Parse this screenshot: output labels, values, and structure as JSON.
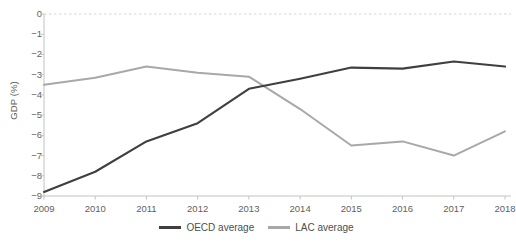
{
  "axis": {
    "y_title": "GDP (%)",
    "y_ticks": [
      "0",
      "-1",
      "-2",
      "-3",
      "-4",
      "-5",
      "-6",
      "-7",
      "-8",
      "-9"
    ],
    "x_ticks": [
      "2009",
      "2010",
      "2011",
      "2012",
      "2013",
      "2014",
      "2015",
      "2016",
      "2017",
      "2018"
    ]
  },
  "legend": {
    "items": [
      {
        "label": "OECD average",
        "color": "#3f3f3f"
      },
      {
        "label": "LAC average",
        "color": "#a8a8a8"
      }
    ]
  },
  "colors": {
    "oecd": "#3f3f3f",
    "lac": "#a8a8a8",
    "zero_line": "#d6d6d6",
    "axis": "#c2c2c2",
    "text": "#5f5f5f",
    "background": "#ffffff"
  },
  "chart_data": {
    "type": "line",
    "title": "",
    "xlabel": "",
    "ylabel": "GDP (%)",
    "x": [
      2009,
      2010,
      2011,
      2012,
      2013,
      2014,
      2015,
      2016,
      2017,
      2018
    ],
    "categories": [
      "2009",
      "2010",
      "2011",
      "2012",
      "2013",
      "2014",
      "2015",
      "2016",
      "2017",
      "2018"
    ],
    "ylim": [
      -9,
      0
    ],
    "xlim": [
      2009,
      2018
    ],
    "grid": false,
    "zero_reference_line": 0,
    "legend_position": "bottom-center",
    "series": [
      {
        "name": "OECD average",
        "color": "#3f3f3f",
        "values": [
          -8.8,
          -7.8,
          -6.3,
          -5.4,
          -3.7,
          -3.2,
          -2.65,
          -2.7,
          -2.35,
          -2.6
        ]
      },
      {
        "name": "LAC average",
        "color": "#a8a8a8",
        "values": [
          -3.5,
          -3.15,
          -2.6,
          -2.9,
          -3.1,
          -4.7,
          -6.5,
          -6.3,
          -7.0,
          -5.8
        ]
      }
    ]
  }
}
